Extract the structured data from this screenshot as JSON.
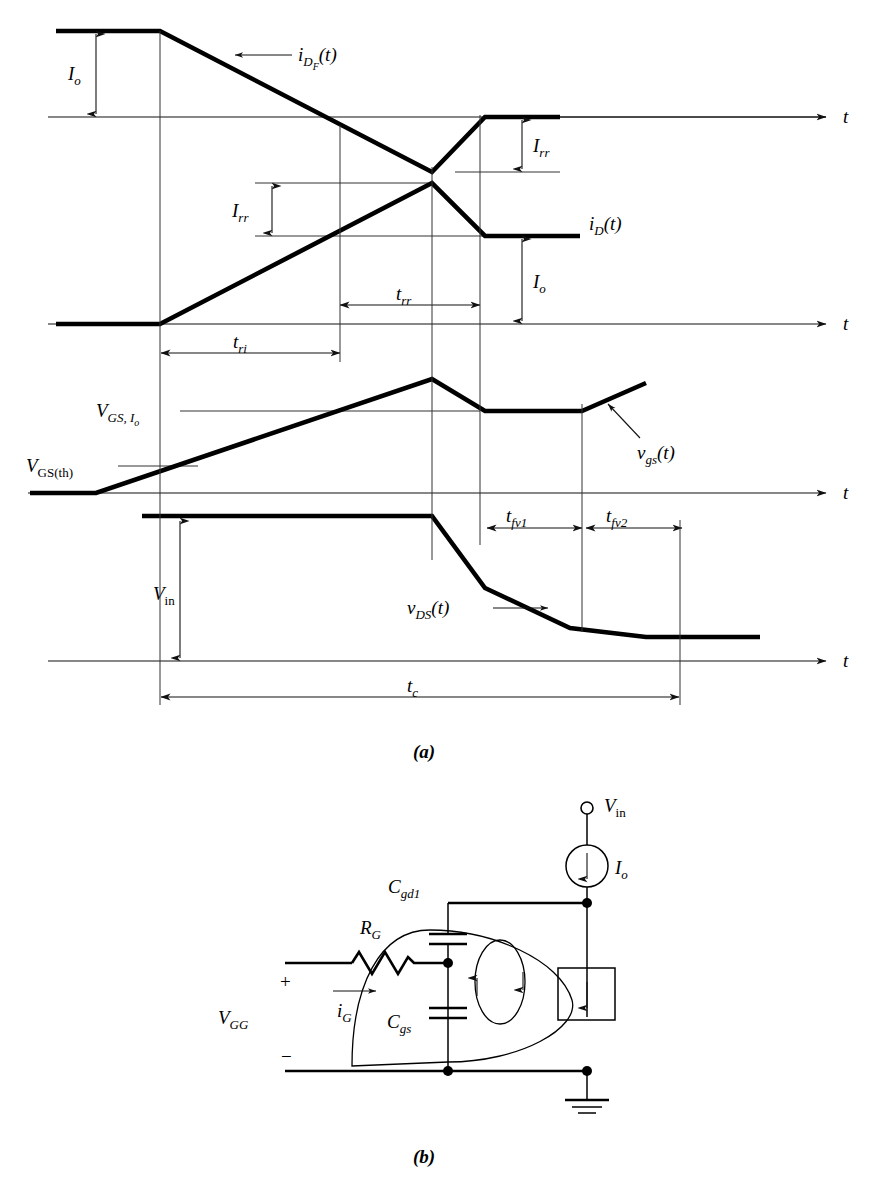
{
  "figure": {
    "part_a_caption": "(a)",
    "part_b_caption": "(b)"
  },
  "waveforms": {
    "diode_current": {
      "name": "i_DF(t)",
      "label_main": "i",
      "label_sub": "D",
      "label_subsub": "F",
      "label_tail": "(t)",
      "axis_label": "t",
      "amplitude_label_main": "I",
      "amplitude_label_sub": "o",
      "reverse_recovery_label_main": "I",
      "reverse_recovery_label_sub": "rr",
      "description": "Forward diode current starts at Io, ramps down through zero to -Irr, recovers to zero"
    },
    "drain_current": {
      "name": "i_D(t)",
      "label_main": "i",
      "label_sub": "D",
      "label_tail": "(t)",
      "axis_label": "t",
      "amplitude_label_main": "I",
      "amplitude_label_sub": "o",
      "overshoot_label_main": "I",
      "overshoot_label_sub": "rr",
      "rise_time_label_main": "t",
      "rise_time_label_sub": "ri",
      "recovery_time_label_main": "t",
      "recovery_time_label_sub": "rr",
      "description": "Drain current ramps from 0 to Io+Irr then falls back to Io"
    },
    "gate_voltage": {
      "name": "v_gs(t)",
      "label_main": "v",
      "label_sub": "gs",
      "label_tail": "(t)",
      "axis_label": "t",
      "threshold_label_main": "V",
      "threshold_label_sub": "GS(th)",
      "plateau_label_main": "V",
      "plateau_label_sub": "GS, I",
      "plateau_label_subsub": "o",
      "description": "Gate-source voltage ramps up past threshold, peaks, drops to Miller plateau, then rises again"
    },
    "drain_voltage": {
      "name": "v_DS(t)",
      "label_main": "v",
      "label_sub": "DS",
      "label_tail": "(t)",
      "axis_label": "t",
      "amplitude_label_main": "V",
      "amplitude_label_sub": "in",
      "fall_time_1_main": "t",
      "fall_time_1_sub": "fv1",
      "fall_time_2_main": "t",
      "fall_time_2_sub": "fv2",
      "description": "Drain-source voltage holds at Vin then falls in two slopes to near zero"
    },
    "crossover_time": {
      "label_main": "t",
      "label_sub": "c",
      "description": "Total crossover / turn-on time"
    }
  },
  "circuit": {
    "input_voltage": {
      "label_main": "V",
      "label_sub": "in"
    },
    "current_source": {
      "label_main": "I",
      "label_sub": "o",
      "symbol": "current-source-circle-with-down-arrow"
    },
    "gate_resistor": {
      "label_main": "R",
      "label_sub": "G",
      "symbol": "zigzag-resistor"
    },
    "gate_drain_cap": {
      "label_main": "C",
      "label_sub": "gd1",
      "symbol": "capacitor"
    },
    "gate_source_cap": {
      "label_main": "C",
      "label_sub": "gs",
      "symbol": "capacitor"
    },
    "gate_supply": {
      "label_main": "V",
      "label_sub": "GG",
      "plus_terminal": "+",
      "minus_terminal": "−"
    },
    "gate_current": {
      "label_main": "i",
      "label_sub": "G",
      "symbol": "current-arrow"
    },
    "dependent_source": {
      "symbol": "boxed-down-arrow-dependent-current-source"
    },
    "ground": {
      "symbol": "ground-symbol"
    },
    "terminal": {
      "symbol": "open-circle-terminal"
    }
  }
}
